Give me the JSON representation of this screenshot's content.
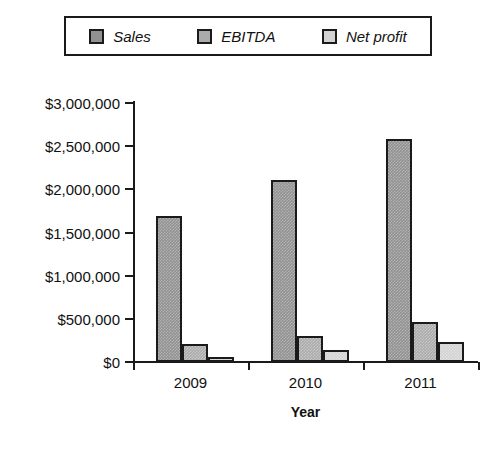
{
  "chart_data": {
    "type": "bar",
    "title": "",
    "xlabel": "Year",
    "ylabel": "",
    "categories": [
      "2009",
      "2010",
      "2011"
    ],
    "series": [
      {
        "name": "Sales",
        "color": "#919191",
        "values": [
          1690000,
          2110000,
          2580000
        ]
      },
      {
        "name": "EBITDA",
        "color": "#ababab",
        "values": [
          210000,
          300000,
          460000
        ]
      },
      {
        "name": "Net profit",
        "color": "#d2d2d2",
        "values": [
          60000,
          140000,
          230000
        ]
      }
    ],
    "ylim": [
      0,
      3000000
    ],
    "ytick_values": [
      0,
      500000,
      1000000,
      1500000,
      2000000,
      2500000,
      3000000
    ],
    "ytick_labels": [
      "$0",
      "$500,000",
      "$1,000,000",
      "$1,500,000",
      "$2,000,000",
      "$2,500,000",
      "$3,000,000"
    ],
    "grid": false,
    "legend_position": "top",
    "legend_entries": [
      "Sales",
      "EBITDA",
      "Net profit"
    ]
  },
  "legend": {
    "items": [
      {
        "label": "Sales"
      },
      {
        "label": "EBITDA"
      },
      {
        "label": "Net profit"
      }
    ]
  },
  "axes": {
    "x_title": "Year"
  }
}
